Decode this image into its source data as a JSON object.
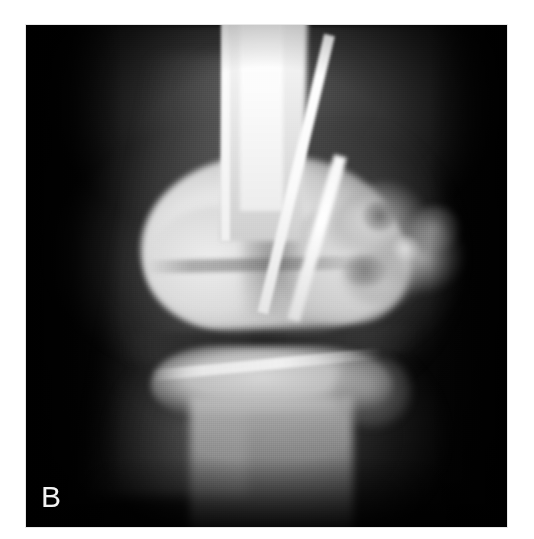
{
  "figure": {
    "panel_label": "B",
    "modality": "radiograph",
    "view": "anteroposterior",
    "body_region": "knee",
    "color_mode": "grayscale",
    "page_background": "#ffffff",
    "film_background": "#000000",
    "label_color": "#f4f4f4"
  },
  "frame": {
    "x": 26,
    "y": 25,
    "width": 481,
    "height": 502
  },
  "anatomy": [
    {
      "name": "femoral-shaft",
      "label": "Femoral shaft"
    },
    {
      "name": "femoral-cortex-medial",
      "label": "Medial femoral cortex"
    },
    {
      "name": "femoral-cortex-lateral",
      "label": "Lateral femoral cortex"
    },
    {
      "name": "distal-femur-condyles",
      "label": "Distal femoral condyles"
    },
    {
      "name": "intercondylar-notch",
      "label": "Intercondylar notch"
    },
    {
      "name": "distal-femoral-physis",
      "label": "Distal femoral growth plate"
    },
    {
      "name": "knee-joint-space",
      "label": "Knee joint space"
    },
    {
      "name": "tibial-plateau",
      "label": "Tibial plateau"
    },
    {
      "name": "proximal-tibial-physis",
      "label": "Proximal tibial growth plate"
    },
    {
      "name": "tibial-shaft",
      "label": "Tibial shaft"
    },
    {
      "name": "fibular-head",
      "label": "Fibular head"
    },
    {
      "name": "lateral-bone-lesion",
      "label": "Lateral mineralised bone lesion"
    },
    {
      "name": "soft-tissue-shadow",
      "label": "Soft tissue shadow"
    }
  ]
}
